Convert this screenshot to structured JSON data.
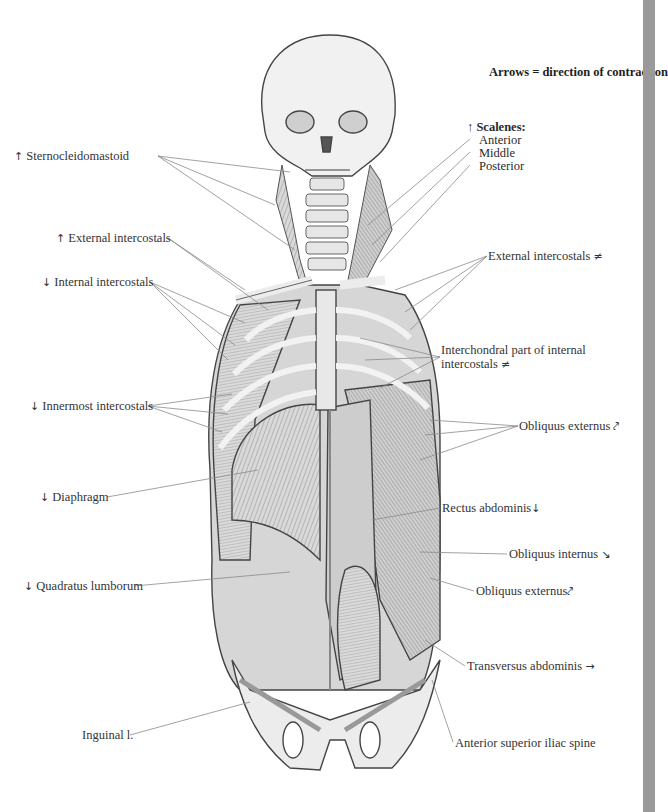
{
  "figure": {
    "legend_title": "Arrows = direction of contraction",
    "colors": {
      "background": "#ffffff",
      "side_strip": "#9a9a9a",
      "leader_line": "#8a8a8a",
      "text": "#333333"
    },
    "labels_left": [
      {
        "id": "sternocleidomastoid",
        "arrow": "↑",
        "text": "Sternocleidomastoid"
      },
      {
        "id": "external-intercostals-left",
        "arrow": "↑",
        "text": "External intercostals"
      },
      {
        "id": "internal-intercostals",
        "arrow": "↓",
        "text": "Internal intercostals"
      },
      {
        "id": "innermost-intercostals",
        "arrow": "↓",
        "text": "Innermost intercostals"
      },
      {
        "id": "diaphragm",
        "arrow": "↓",
        "text": "Diaphragm"
      },
      {
        "id": "quadratus-lumborum",
        "arrow": "↓",
        "text": "Quadratus lumborum"
      },
      {
        "id": "inguinal-ligament",
        "arrow": "",
        "text": "Inguinal l."
      }
    ],
    "scalenes": {
      "arrow": "↑",
      "heading": "Scalenes:",
      "parts": [
        "Anterior",
        "Middle",
        "Posterior"
      ]
    },
    "labels_right": [
      {
        "id": "external-intercostals-right",
        "text": "External intercostals",
        "arrow": "≠"
      },
      {
        "id": "interchondral",
        "text": "Interchondral part of internal intercostals",
        "arrow": "≠"
      },
      {
        "id": "obliquus-externus-upper",
        "text": "Obliquus externus",
        "arrow": "⤤"
      },
      {
        "id": "rectus-abdominis",
        "text": "Rectus abdominis",
        "arrow": "↓"
      },
      {
        "id": "obliquus-internus",
        "text": "Obliquus internus",
        "arrow": "↘"
      },
      {
        "id": "obliquus-externus-lower",
        "text": "Obliquus externus",
        "arrow": "⤤"
      },
      {
        "id": "transversus-abdominis",
        "text": "Transversus abdominis",
        "arrow": "→"
      },
      {
        "id": "asis",
        "text": "Anterior superior iliac spine",
        "arrow": ""
      }
    ]
  }
}
